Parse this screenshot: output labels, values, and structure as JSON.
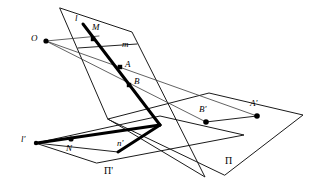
{
  "figure": {
    "width": 314,
    "height": 187,
    "background_color": "#ffffff",
    "stroke_color": "#1a1a1a",
    "thick_stroke_color": "#000000",
    "ray_color": "#3a3a3a"
  },
  "labels": {
    "O": "O",
    "l": "l",
    "M": "M",
    "m": "m",
    "A": "A",
    "B": "B",
    "B_prime": "B'",
    "A_prime": "A'",
    "Pi": "П",
    "l_prime": "l'",
    "N": "N",
    "n_prime": "n'",
    "Pi_prime": "П'"
  },
  "label_positions": {
    "O": {
      "x": 31,
      "y": 34
    },
    "l": {
      "x": 75,
      "y": 14
    },
    "M": {
      "x": 92,
      "y": 23
    },
    "m": {
      "x": 122,
      "y": 40
    },
    "A": {
      "x": 125,
      "y": 60
    },
    "B": {
      "x": 134,
      "y": 77
    },
    "B_prime": {
      "x": 199,
      "y": 105
    },
    "A_prime": {
      "x": 250,
      "y": 99
    },
    "Pi": {
      "x": 225,
      "y": 156
    },
    "l_prime": {
      "x": 21,
      "y": 135
    },
    "N": {
      "x": 66,
      "y": 144
    },
    "n_prime": {
      "x": 117,
      "y": 139
    },
    "Pi_prime": {
      "x": 104,
      "y": 166
    }
  },
  "points": {
    "O": {
      "x": 46,
      "y": 41,
      "shape": "dot",
      "r": 2.6
    },
    "M": {
      "x": 93,
      "y": 39,
      "shape": "square",
      "s": 4.4
    },
    "A": {
      "x": 120,
      "y": 67,
      "shape": "square",
      "s": 4.4
    },
    "B": {
      "x": 129,
      "y": 85,
      "shape": "square",
      "s": 4.4
    },
    "B_prime": {
      "x": 206,
      "y": 122,
      "shape": "dot",
      "r": 2.8
    },
    "A_prime": {
      "x": 257,
      "y": 116,
      "shape": "dot",
      "r": 2.8
    },
    "N": {
      "x": 71,
      "y": 139,
      "shape": "dot",
      "r": 2.6
    },
    "l_prime_end": {
      "x": 36,
      "y": 143,
      "shape": "dot",
      "r": 2.2
    }
  },
  "planes": {
    "upper_oblique": {
      "name": "oblique-plane",
      "vertices": [
        {
          "x": 60,
          "y": 8
        },
        {
          "x": 132,
          "y": 32
        },
        {
          "x": 205,
          "y": 177
        },
        {
          "x": 108,
          "y": 119
        }
      ]
    },
    "Pi": {
      "name": "plane-pi",
      "vertices": [
        {
          "x": 108,
          "y": 119
        },
        {
          "x": 209,
          "y": 93
        },
        {
          "x": 303,
          "y": 115
        },
        {
          "x": 225,
          "y": 175
        }
      ]
    },
    "Pi_prime": {
      "name": "plane-pi-prime",
      "vertices": [
        {
          "x": 36,
          "y": 143
        },
        {
          "x": 160,
          "y": 116
        },
        {
          "x": 244,
          "y": 135
        },
        {
          "x": 97,
          "y": 163
        }
      ]
    }
  },
  "lines": {
    "l_thick": {
      "from": {
        "x": 83,
        "y": 24
      },
      "to": {
        "x": 160,
        "y": 125
      }
    },
    "n_prime_thick": {
      "from": {
        "x": 160,
        "y": 125
      },
      "to": {
        "x": 118,
        "y": 152
      }
    },
    "l_prime_thick": {
      "from": {
        "x": 160,
        "y": 125
      },
      "to": {
        "x": 37,
        "y": 143
      }
    },
    "m_thin": {
      "from": {
        "x": 78,
        "y": 48
      },
      "to": {
        "x": 137,
        "y": 44
      }
    },
    "ray_O_M": {
      "from": {
        "x": 46,
        "y": 41
      },
      "to": {
        "x": 96,
        "y": 37
      }
    },
    "ray_O_A_Aprime": {
      "from": {
        "x": 46,
        "y": 41
      },
      "to": {
        "x": 257,
        "y": 116
      }
    },
    "ray_O_B_Bprime": {
      "from": {
        "x": 46,
        "y": 41
      },
      "to": {
        "x": 206,
        "y": 122
      }
    },
    "Aprime_Bprime": {
      "from": {
        "x": 206,
        "y": 122
      },
      "to": {
        "x": 257,
        "y": 116
      }
    },
    "N_l_prime": {
      "from": {
        "x": 36,
        "y": 143
      },
      "to": {
        "x": 118,
        "y": 152
      }
    }
  }
}
